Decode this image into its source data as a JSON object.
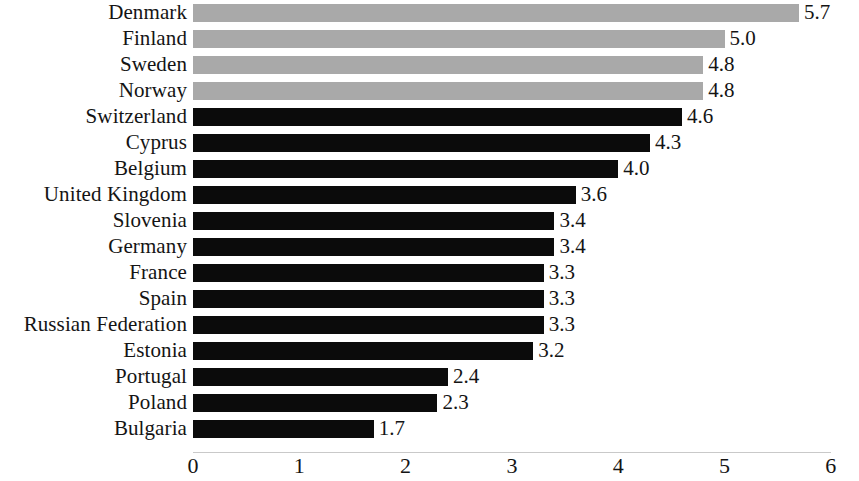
{
  "chart_data": {
    "type": "bar",
    "orientation": "horizontal",
    "title": "",
    "subtitle": "",
    "xlabel": "",
    "ylabel": "",
    "xlim": [
      0,
      6
    ],
    "xticks": [
      0,
      1,
      2,
      3,
      4,
      5,
      6
    ],
    "xtick_labels": [
      "0",
      "1",
      "2",
      "3",
      "4",
      "5",
      "6"
    ],
    "grid": false,
    "legend": null,
    "value_labels": true,
    "colors": {
      "highlight_bar": "#a9a9a9",
      "default_bar": "#0b0b0b",
      "background": "#ffffff",
      "text": "#141414",
      "axis_line": "#c9c9c9"
    },
    "categories": [
      "Denmark",
      "Finland",
      "Sweden",
      "Norway",
      "Switzerland",
      "Cyprus",
      "Belgium",
      "United Kingdom",
      "Slovenia",
      "Germany",
      "France",
      "Spain",
      "Russian Federation",
      "Estonia",
      "Portugal",
      "Poland",
      "Bulgaria"
    ],
    "values": [
      5.7,
      5.0,
      4.8,
      4.8,
      4.6,
      4.3,
      4.0,
      3.6,
      3.4,
      3.4,
      3.3,
      3.3,
      3.3,
      3.2,
      2.4,
      2.3,
      1.7
    ],
    "value_label_texts": [
      "5.7",
      "5.0",
      "4.8",
      "4.8",
      "4.6",
      "4.3",
      "4.0",
      "3.6",
      "3.4",
      "3.4",
      "3.3",
      "3.3",
      "3.3",
      "3.2",
      "2.4",
      "2.3",
      "1.7"
    ],
    "bar_styles": [
      "gray",
      "gray",
      "gray",
      "gray",
      "black",
      "black",
      "black",
      "black",
      "black",
      "black",
      "black",
      "black",
      "black",
      "black",
      "black",
      "black",
      "black"
    ]
  }
}
